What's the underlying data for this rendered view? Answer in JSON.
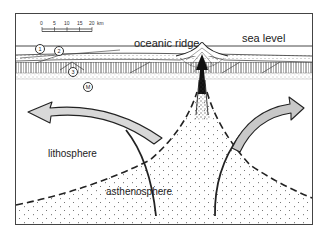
{
  "labels": {
    "oceanic_ridge": "oceanic ridge",
    "sea_level": "sea level",
    "lithosphere": "lithosphere",
    "asthenosphere": "asthenosphere"
  },
  "scale_bar": {
    "ticks": [
      "0",
      "5",
      "10",
      "15",
      "20"
    ],
    "unit": "km"
  },
  "layer_markers": [
    "1",
    "2",
    "3",
    "M"
  ],
  "colors": {
    "line": "#222222",
    "arrow_fill": "#c8c8c8",
    "frame": "#444444",
    "background": "#ffffff"
  }
}
